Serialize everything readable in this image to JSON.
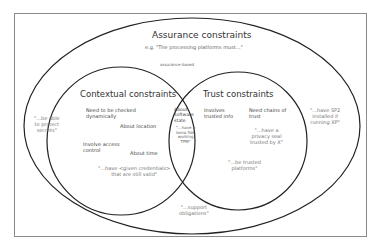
{
  "diagram": {
    "outer": {
      "title": "Assurance constraints",
      "example": "e.g. \"The processing platforms must...\"",
      "connector_label": "assurance-based",
      "quote_left": "\"...be able\nto protect\nsecrets\"",
      "quote_right": "\"...have SP2\ninstalled if\nrunning XP\"",
      "quote_bottom": "\"...support\nobligations\""
    },
    "contextual": {
      "title": "Contextual constraints",
      "item_1": "Need to be checked\ndynamically",
      "item_2": "About location",
      "item_3": "Involve access\ncontrol",
      "item_4": "About time",
      "quote": "\"...have <given credentials>\nthat are still valid\""
    },
    "intersection": {
      "label": "About\nsoftware\nstate",
      "quote": "\"...have a\nbona fide\nworking\nTPM\""
    },
    "trust": {
      "title": "Trust constraints",
      "item_1": "Involves\ntrusted info",
      "item_2": "Need chains of\ntrust",
      "quote_1": "\"...have a\nprivacy seal\ntrusted by X\"",
      "quote_2": "\"...be trusted\nplatforms\""
    }
  }
}
